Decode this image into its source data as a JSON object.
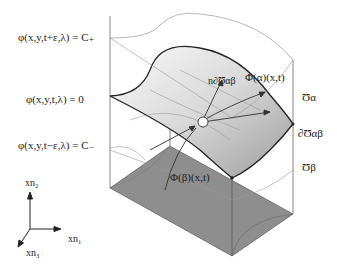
{
  "diagram": {
    "type": "3d-level-set-interface",
    "labels": {
      "upper_level": "φ(x,y,t+ε,λ) = C₊",
      "zero_level": "φ(x,y,t,λ) = 0",
      "lower_level": "φ(x,y,t−ε,λ) = C₋",
      "normal": "n∂Ʊαβ",
      "phi_alpha": "Φ(α)(x,t)",
      "phi_beta": "Φ(β)(x,t)",
      "region_alpha": "Ʊα",
      "interface": "∂Ʊαβ",
      "region_beta": "Ʊβ"
    },
    "axes": {
      "x_up": "xn₂",
      "x_right": "xn₁",
      "x_diag": "xn₃"
    },
    "colors": {
      "surface_light": "#f0f0f0",
      "surface_mid": "#b8b8b8",
      "base_dark": "#8a8a8a",
      "base_side": "#a0a0a0",
      "line": "#222222",
      "thin_line": "#9a9a9a"
    }
  }
}
